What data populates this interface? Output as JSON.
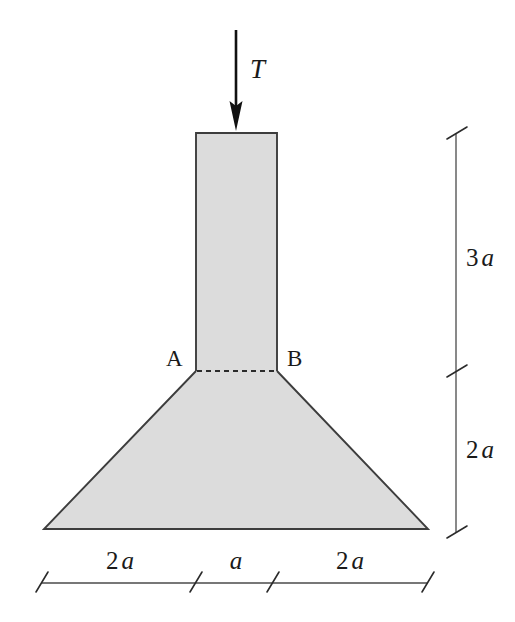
{
  "figure": {
    "background_color": "#ffffff",
    "body_fill_color": "#dcdcdc",
    "outline_color": "#3d3d3d",
    "load": {
      "label": "T",
      "direction": "down",
      "arrow_color": "#111111"
    },
    "section_labels": [
      {
        "name": "A",
        "text": "A"
      },
      {
        "name": "B",
        "text": "B"
      }
    ],
    "vertical_dimensions": [
      {
        "name": "upper-column-height",
        "value": "3",
        "unit": "a",
        "text": "3a"
      },
      {
        "name": "lower-taper-height",
        "value": "2",
        "unit": "a",
        "text": "2a"
      }
    ],
    "horizontal_dimensions": [
      {
        "name": "left-overhang",
        "value": "2",
        "unit": "a",
        "text": "2a"
      },
      {
        "name": "column-width",
        "value": "",
        "unit": "a",
        "text": "a"
      },
      {
        "name": "right-overhang",
        "value": "2",
        "unit": "a",
        "text": "2a"
      }
    ],
    "geometry_notes": {
      "column_top_width": "a",
      "base_width": "5a",
      "total_height": "5a",
      "dashed_line": "section A-B"
    }
  }
}
